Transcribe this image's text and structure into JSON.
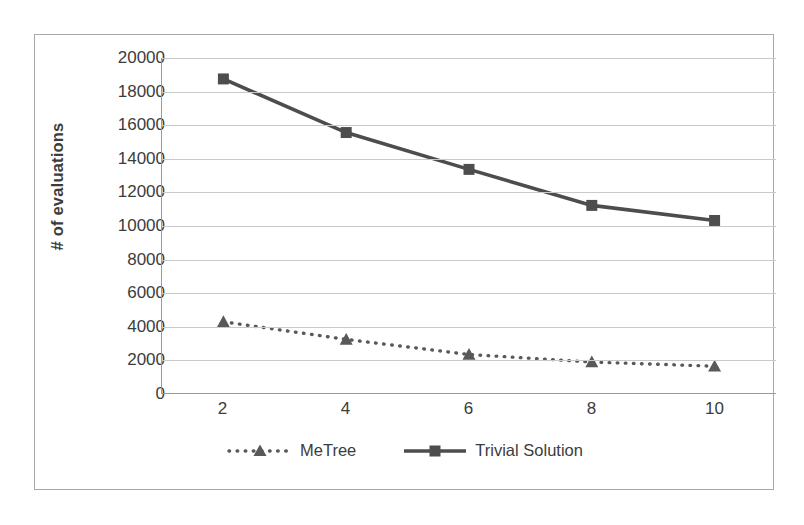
{
  "chart_data": {
    "type": "line",
    "title": "",
    "xlabel": "",
    "ylabel": "# of evaluations",
    "categories": [
      "2",
      "4",
      "6",
      "8",
      "10"
    ],
    "x": [
      2,
      4,
      6,
      8,
      10
    ],
    "ylim": [
      0,
      20000
    ],
    "ytick_step": 2000,
    "yticks": [
      "20000",
      "18000",
      "16000",
      "14000",
      "12000",
      "10000",
      "8000",
      "6000",
      "4000",
      "2000",
      "0"
    ],
    "ytick_values": [
      20000,
      18000,
      16000,
      14000,
      12000,
      10000,
      8000,
      6000,
      4000,
      2000,
      0
    ],
    "grid": true,
    "legend_position": "bottom",
    "series": [
      {
        "name": "MeTree",
        "values": [
          4250,
          3200,
          2300,
          1850,
          1600
        ],
        "line_style": "dotted",
        "marker": "triangle",
        "color": "#595959"
      },
      {
        "name": "Trivial Solution",
        "values": [
          18750,
          15550,
          13350,
          11200,
          10300
        ],
        "line_style": "solid",
        "marker": "square",
        "color": "#4d4d4d"
      }
    ]
  },
  "legend": {
    "items": [
      {
        "label": "MeTree"
      },
      {
        "label": "Trivial Solution"
      }
    ]
  },
  "colors": {
    "grid": "#c9c9c9",
    "axis": "#9a9a9a",
    "frame": "#a8a8a8",
    "text": "#3c3c3c",
    "metree": "#595959",
    "trivial": "#4d4d4d"
  }
}
